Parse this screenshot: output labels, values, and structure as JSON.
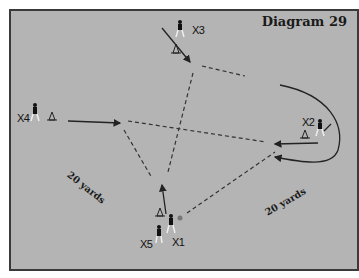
{
  "diagram": {
    "title": "Diagram 29",
    "background_color": "#b4b4b4",
    "players": [
      {
        "id": "X1",
        "label": "X1"
      },
      {
        "id": "X2",
        "label": "X2"
      },
      {
        "id": "X3",
        "label": "X3"
      },
      {
        "id": "X4",
        "label": "X4"
      },
      {
        "id": "X5",
        "label": "X5"
      }
    ],
    "distance_labels": [
      {
        "label": "20 yards",
        "position": "left"
      },
      {
        "label": "20 yards",
        "position": "right"
      }
    ],
    "legend": {
      "solid_line": "player run",
      "dashed_line": "pass",
      "cone": "cone marker",
      "ball": "ball"
    }
  }
}
